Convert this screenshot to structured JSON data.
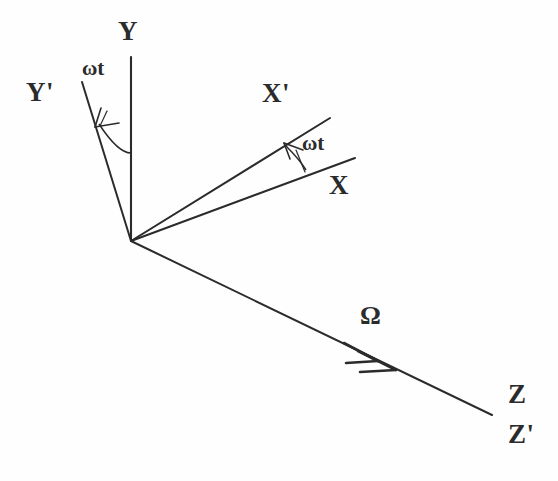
{
  "figure": {
    "background_color": "#fefefe",
    "stroke_color": "#2b2b2b",
    "width": 558,
    "height": 481
  },
  "labels": {
    "y": "Y",
    "y_prime": "Y'",
    "x_prime": "X'",
    "x": "X",
    "z": "Z",
    "z_prime": "Z'",
    "omega_t_left": "ωt",
    "omega_t_right": "ωt",
    "omega": "Ω"
  },
  "geometry": {
    "origin": {
      "x": 131,
      "y": 241
    },
    "axes": [
      {
        "name": "Y",
        "from": [
          131,
          241
        ],
        "to": [
          131,
          57
        ],
        "label": "Y"
      },
      {
        "name": "Y'",
        "from": [
          131,
          241
        ],
        "to": [
          82,
          82
        ],
        "label": "Y'"
      },
      {
        "name": "X",
        "from": [
          131,
          241
        ],
        "to": [
          355,
          158
        ],
        "label": "X"
      },
      {
        "name": "X'",
        "from": [
          131,
          241
        ],
        "to": [
          330,
          118
        ],
        "label": "X'"
      },
      {
        "name": "Z",
        "from": [
          131,
          241
        ],
        "to": [
          492,
          415
        ],
        "label": "Z"
      }
    ],
    "angle_arcs": [
      {
        "name": "omega-t-Y-to-Y-prime",
        "from_axis": "Y",
        "to_axis": "Y'",
        "arrow_direction": "counterclockwise",
        "label": "ωt"
      },
      {
        "name": "omega-t-X-to-X-prime",
        "from_axis": "X",
        "to_axis": "X'",
        "arrow_direction": "counterclockwise",
        "label": "ωt"
      }
    ],
    "vectors": [
      {
        "name": "angular-velocity-vector",
        "label": "Ω",
        "along_axis": "Z",
        "arrowhead": "double",
        "tip": [
          395,
          368
        ]
      }
    ]
  },
  "annotations": {
    "description": "Body-fixed primed axes X', Y' rotated by angle omega-t from the inertial X, Y axes; Z and Z' coincide along the angular velocity vector Omega."
  }
}
